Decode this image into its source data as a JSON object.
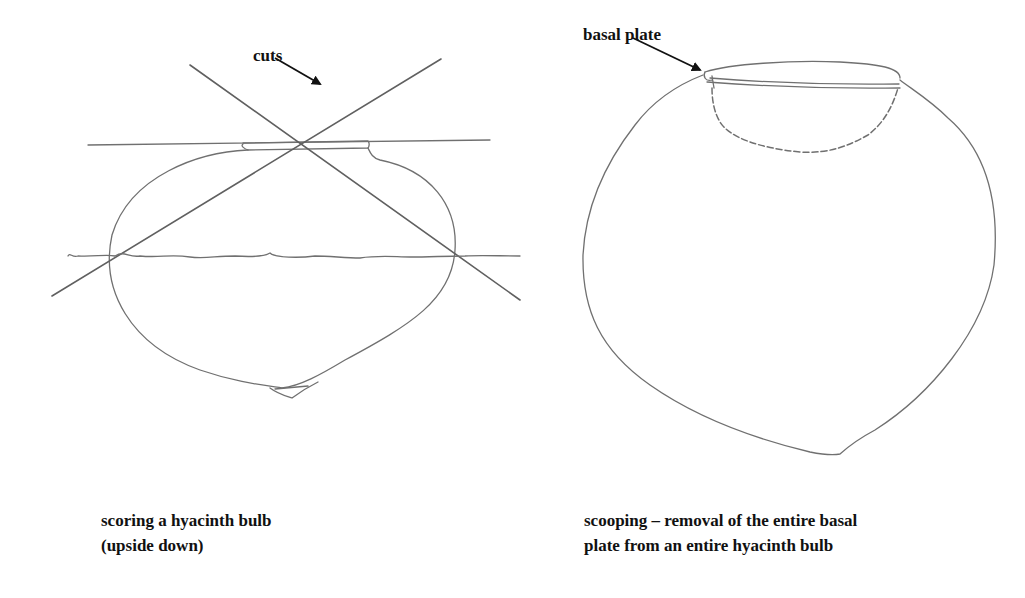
{
  "figure_left": {
    "annotation": "cuts",
    "caption_lines": [
      "scoring a hyacinth bulb",
      "(upside down)"
    ]
  },
  "figure_right": {
    "annotation": "basal plate",
    "caption_lines": [
      "scooping – removal of the entire basal",
      "plate from an entire hyacinth bulb"
    ]
  },
  "colors": {
    "pencil": "#6e6e6e",
    "ink": "#111111",
    "background": "#ffffff"
  }
}
